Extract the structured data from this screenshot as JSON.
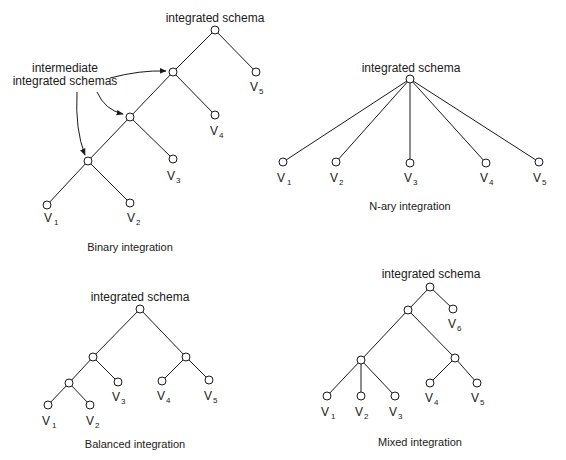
{
  "diagrams": {
    "binary": {
      "caption": "Binary integration",
      "root_label": "integrated schema",
      "annotation_line1": "intermediate",
      "annotation_line2": "integrated schemas",
      "leaves": [
        "V",
        "V",
        "V",
        "V",
        "V"
      ],
      "subs": [
        "1",
        "2",
        "3",
        "4",
        "5"
      ]
    },
    "nary": {
      "caption": "N-ary integration",
      "root_label": "integrated schema",
      "leaves": [
        "V",
        "V",
        "V",
        "V",
        "V"
      ],
      "subs": [
        "1",
        "2",
        "3",
        "4",
        "5"
      ]
    },
    "balanced": {
      "caption": "Balanced integration",
      "root_label": "integrated schema",
      "leaves": [
        "V",
        "V",
        "V",
        "V",
        "V"
      ],
      "subs": [
        "1",
        "2",
        "3",
        "4",
        "5"
      ]
    },
    "mixed": {
      "caption": "Mixed integration",
      "root_label": "integrated schema",
      "leaves": [
        "V",
        "V",
        "V",
        "V",
        "V",
        "V"
      ],
      "subs": [
        "1",
        "2",
        "3",
        "4",
        "5",
        "6"
      ]
    }
  },
  "colors": {
    "ink": "#1a1a1a",
    "background": "#ffffff"
  }
}
